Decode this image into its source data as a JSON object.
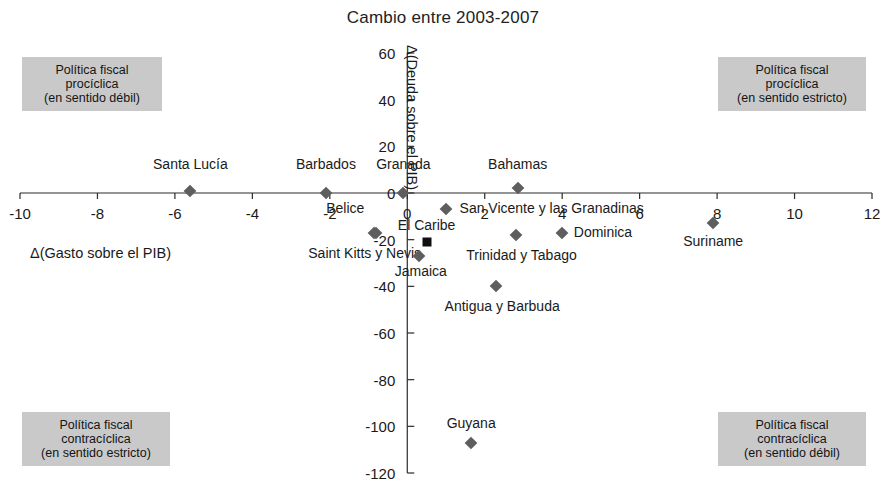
{
  "chart_data": {
    "type": "scatter",
    "title": "Cambio entre 2003-2007",
    "xlabel": "Δ(Gasto sobre el PIB)",
    "ylabel": "Δ(Deuda sobre el PIB)",
    "xlim": [
      -10,
      12
    ],
    "ylim": [
      -120,
      60
    ],
    "xticks": [
      "-10",
      "-8",
      "-6",
      "-4",
      "-2",
      "0",
      "2",
      "4",
      "6",
      "8",
      "10",
      "12"
    ],
    "xtick_values": [
      -10,
      -8,
      -6,
      -4,
      -2,
      0,
      2,
      4,
      6,
      8,
      10,
      12
    ],
    "yticks": [
      "60",
      "40",
      "20",
      "0",
      "-20",
      "-40",
      "-60",
      "-80",
      "-100",
      "-120"
    ],
    "ytick_values": [
      60,
      40,
      20,
      0,
      -20,
      -40,
      -60,
      -80,
      -100,
      -120
    ],
    "grid": false,
    "legend": "none",
    "marker_color": "#5e5e5e",
    "highlight_color": "#101010",
    "points": [
      {
        "label": "Santa Lucía",
        "x": -5.6,
        "y": 1,
        "lx": -5.6,
        "ly": 12,
        "align": "c",
        "marker": "diamond"
      },
      {
        "label": "Barbados",
        "x": -2.1,
        "y": 0,
        "lx": -2.1,
        "ly": 12,
        "align": "c",
        "marker": "diamond"
      },
      {
        "label": "Granada",
        "x": -0.1,
        "y": 0,
        "lx": -0.1,
        "ly": 12,
        "align": "c",
        "marker": "diamond"
      },
      {
        "label": "Belice",
        "x": -0.8,
        "y": -17,
        "lx": -1.6,
        "ly": -7,
        "align": "c",
        "marker": "diamond"
      },
      {
        "label": "Saint Kitts y Nevis",
        "x": -0.85,
        "y": -17,
        "lx": -1.1,
        "ly": -26,
        "align": "c",
        "marker": "diamond"
      },
      {
        "label": "Bahamas",
        "x": 2.85,
        "y": 2,
        "lx": 2.85,
        "ly": 12,
        "align": "c",
        "marker": "diamond"
      },
      {
        "label": "San Vicente y las Granadinas",
        "x": 1.0,
        "y": -7,
        "lx": 1.35,
        "ly": -7,
        "align": "l",
        "marker": "diamond"
      },
      {
        "label": "El Caribe",
        "x": 0.5,
        "y": -21,
        "lx": 0.5,
        "ly": -14,
        "align": "c",
        "marker": "square"
      },
      {
        "label": "Dominica",
        "x": 4.0,
        "y": -17,
        "lx": 4.3,
        "ly": -17,
        "align": "l",
        "marker": "diamond"
      },
      {
        "label": "Trinidad y Tabago",
        "x": 2.8,
        "y": -18,
        "lx": 2.95,
        "ly": -27,
        "align": "c",
        "marker": "diamond"
      },
      {
        "label": "Jamaica",
        "x": 0.3,
        "y": -27,
        "lx": 0.35,
        "ly": -34,
        "align": "c",
        "marker": "diamond"
      },
      {
        "label": "Antigua y Barbuda",
        "x": 2.3,
        "y": -40,
        "lx": 2.45,
        "ly": -49,
        "align": "c",
        "marker": "diamond"
      },
      {
        "label": "Suriname",
        "x": 7.9,
        "y": -13,
        "lx": 7.9,
        "ly": -21,
        "align": "c",
        "marker": "diamond"
      },
      {
        "label": "Guyana",
        "x": 1.65,
        "y": -107,
        "lx": 1.65,
        "ly": -99,
        "align": "c",
        "marker": "diamond"
      }
    ],
    "annotations": [
      {
        "id": "top-left",
        "lines": [
          "Política fiscal",
          "procíclica",
          "(en sentido débil)"
        ]
      },
      {
        "id": "top-right",
        "lines": [
          "Política fiscal",
          "procíclica",
          "(en sentido estricto)"
        ]
      },
      {
        "id": "bottom-left",
        "lines": [
          "Política fiscal",
          "contracíclica",
          "(en sentido estricto)"
        ]
      },
      {
        "id": "bottom-right",
        "lines": [
          "Política fiscal",
          "contracíclica",
          "(en sentido débil)"
        ]
      }
    ]
  }
}
